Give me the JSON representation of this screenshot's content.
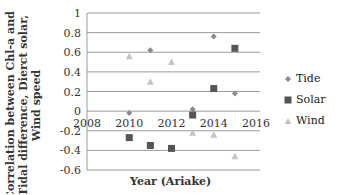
{
  "chart_data": {
    "type": "scatter",
    "title": "",
    "xlabel": "Year (Ariake)",
    "ylabel": "Correlation between Chl-a and Tidal difference, Dierct solar, Wind speed",
    "xlim": [
      2008,
      2016
    ],
    "ylim": [
      -0.6,
      1
    ],
    "x_ticks": [
      "2008",
      "2010",
      "2012",
      "2014",
      "2016"
    ],
    "y_ticks": [
      "1",
      "0.8",
      "0.6",
      "0.4",
      "0.2",
      "0",
      "-0.2",
      "-0.4",
      "-0.6"
    ],
    "grid": "horizontal",
    "legend_position": "right",
    "series": [
      {
        "name": "Tide",
        "marker": "diamond",
        "color": "#8a8a8a",
        "x": [
          2010,
          2011,
          2013,
          2014,
          2015
        ],
        "y": [
          -0.02,
          0.62,
          0.02,
          0.76,
          0.18
        ]
      },
      {
        "name": "Solar",
        "marker": "square",
        "color": "#555555",
        "x": [
          2010,
          2011,
          2012,
          2013,
          2014,
          2015
        ],
        "y": [
          -0.27,
          -0.35,
          -0.38,
          -0.04,
          0.23,
          0.64
        ]
      },
      {
        "name": "Wind",
        "marker": "triangle",
        "color": "#c4c4c4",
        "x": [
          2010,
          2011,
          2012,
          2013,
          2014,
          2015
        ],
        "y": [
          0.56,
          0.3,
          0.5,
          -0.22,
          -0.24,
          -0.46
        ]
      }
    ]
  },
  "labels": {
    "ylabel_lines": [
      "Correlation between Chl-a and",
      "Tidal difference, Dierct solar,",
      "Wind speed"
    ],
    "xlabel": "Year (Ariake)"
  },
  "legend": [
    {
      "label": "Tide"
    },
    {
      "label": "Solar"
    },
    {
      "label": "Wind"
    }
  ]
}
